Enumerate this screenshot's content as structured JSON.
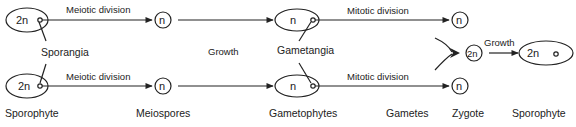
{
  "diagram": {
    "type": "life-cycle",
    "colors": {
      "line": "#222222",
      "background": "#ffffff"
    },
    "nodes": {
      "sporophyte_top": {
        "symbol": "2n"
      },
      "sporophyte_bottom": {
        "symbol": "2n"
      },
      "meiospore_top": {
        "symbol": "n"
      },
      "meiospore_bottom": {
        "symbol": "n"
      },
      "gametophyte_top": {
        "symbol": "n"
      },
      "gametophyte_bottom": {
        "symbol": "n"
      },
      "gamete_top": {
        "symbol": "n"
      },
      "gamete_bottom": {
        "symbol": "n"
      },
      "zygote": {
        "symbol": "2n"
      },
      "sporophyte_final": {
        "symbol": "2n"
      }
    },
    "edge_labels": {
      "meiotic_top": "Meiotic division",
      "meiotic_bottom": "Meiotic division",
      "growth_middle": "Growth",
      "mitotic_top": "Mitotic division",
      "mitotic_bottom": "Mitotic division",
      "growth_final": "Growth"
    },
    "callouts": {
      "sporangia": "Sporangia",
      "gametangia": "Gametangia"
    },
    "stage_labels": [
      "Sporophyte",
      "Meiospores",
      "Gametophytes",
      "Gametes",
      "Zygote",
      "Sporophyte"
    ]
  }
}
